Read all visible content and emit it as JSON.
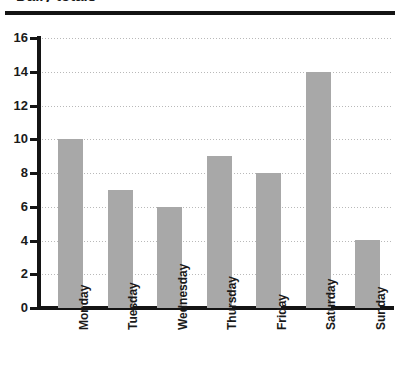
{
  "chart_data": {
    "type": "bar",
    "title": "",
    "xlabel": "",
    "ylabel": "",
    "categories": [
      "Monday",
      "Tuesday",
      "Wednesday",
      "Thursday",
      "Friday",
      "Saturday",
      "Sunday"
    ],
    "values": [
      10,
      7,
      6,
      9,
      8,
      14,
      4
    ],
    "ylim": [
      0,
      16
    ],
    "ytick_values": [
      16,
      14,
      12,
      10,
      8,
      6,
      4,
      2,
      0
    ],
    "ytick_labels": [
      "16",
      "14",
      "12",
      "10",
      "8",
      "6",
      "4",
      "2",
      "0"
    ],
    "ytick_step": 2,
    "grid": true,
    "grid_axis": "y",
    "grid_style": "dotted",
    "legend": false,
    "legend_position": "none",
    "bar_color": "#a8a8a8",
    "axis_color": "#141414",
    "grid_color": "#b9b9b9",
    "text_color": "#1a1a1a",
    "xtick_label_rotation": 90
  },
  "decorations": {
    "top_rule_color": "#141414",
    "cropped_title_fragment": "Daily totals"
  }
}
